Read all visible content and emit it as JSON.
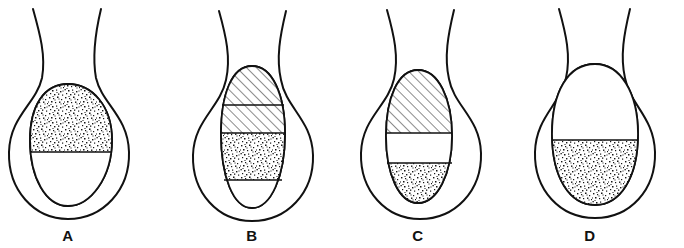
{
  "figure": {
    "background_color": "#ffffff",
    "ink_color": "#111111",
    "width": 684,
    "height": 248
  },
  "legend_textures": {
    "stipple": "stippled-fill",
    "hatch": "diagonal-hatched-fill",
    "blank": "blank-fill"
  },
  "panels": [
    {
      "id": "A",
      "label": "A",
      "label_x": 68,
      "label_y": 241,
      "center_x": 68,
      "outer": {
        "neck_left_top_x": 32,
        "neck_right_top_x": 100,
        "top_y": 8,
        "bottom_y": 219,
        "left_x": 8,
        "right_x": 130
      },
      "inner": {
        "top_y": 84,
        "bottom_y": 206,
        "left_x": 30,
        "right_x": 112
      },
      "regions": [
        {
          "name": "upper",
          "texture": "stipple",
          "from_y": 84,
          "to_y": 152
        },
        {
          "name": "lower",
          "texture": "blank",
          "from_y": 152,
          "to_y": 206
        }
      ],
      "dividers": [
        152
      ]
    },
    {
      "id": "B",
      "label": "B",
      "label_x": 252,
      "label_y": 241,
      "center_x": 252,
      "outer": {
        "neck_left_top_x": 218,
        "neck_right_top_x": 286,
        "top_y": 10,
        "bottom_y": 221,
        "left_x": 192,
        "right_x": 314
      },
      "inner": {
        "top_y": 66,
        "bottom_y": 208,
        "left_x": 221,
        "right_x": 285
      },
      "regions": [
        {
          "name": "upper",
          "texture": "hatch",
          "from_y": 66,
          "to_y": 105
        },
        {
          "name": "middle",
          "texture": "hatch",
          "from_y": 105,
          "to_y": 133
        },
        {
          "name": "lower",
          "texture": "stipple",
          "from_y": 133,
          "to_y": 180
        },
        {
          "name": "bottom",
          "texture": "blank",
          "from_y": 180,
          "to_y": 208
        }
      ],
      "dividers": [
        105,
        133,
        180
      ]
    },
    {
      "id": "C",
      "label": "C",
      "label_x": 418,
      "label_y": 241,
      "center_x": 418,
      "outer": {
        "neck_left_top_x": 386,
        "neck_right_top_x": 452,
        "top_y": 9,
        "bottom_y": 219,
        "left_x": 360,
        "right_x": 482
      },
      "inner": {
        "top_y": 70,
        "bottom_y": 203,
        "left_x": 386,
        "right_x": 452
      },
      "regions": [
        {
          "name": "upper",
          "texture": "hatch",
          "from_y": 70,
          "to_y": 133
        },
        {
          "name": "middle",
          "texture": "blank",
          "from_y": 133,
          "to_y": 163
        },
        {
          "name": "lower",
          "texture": "stipple",
          "from_y": 163,
          "to_y": 203
        }
      ],
      "dividers": [
        133,
        163
      ]
    },
    {
      "id": "D",
      "label": "D",
      "label_x": 590,
      "label_y": 241,
      "center_x": 590,
      "outer": {
        "neck_left_top_x": 558,
        "neck_right_top_x": 624,
        "top_y": 8,
        "bottom_y": 218,
        "left_x": 534,
        "right_x": 656
      },
      "inner": {
        "top_y": 64,
        "bottom_y": 205,
        "left_x": 552,
        "right_x": 638
      },
      "regions": [
        {
          "name": "upper",
          "texture": "blank",
          "from_y": 64,
          "to_y": 140
        },
        {
          "name": "lower",
          "texture": "stipple",
          "from_y": 140,
          "to_y": 205
        }
      ],
      "dividers": [
        140
      ]
    }
  ]
}
